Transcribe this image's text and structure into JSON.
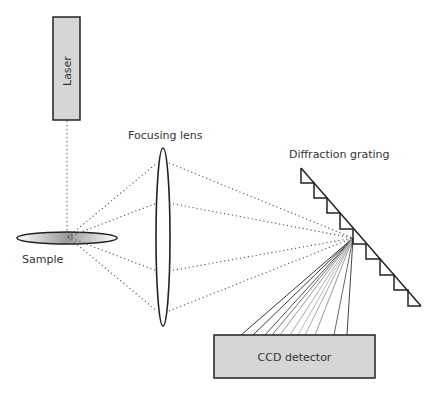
{
  "diagram": {
    "type": "raman-spectrometer-schematic",
    "components": {
      "laser": {
        "label": "Laser"
      },
      "sample": {
        "label": "Sample"
      },
      "lens": {
        "label": "Focusing lens"
      },
      "grating": {
        "label": "Diffraction grating"
      },
      "detector": {
        "label": "CCD detector"
      }
    },
    "colors": {
      "box_fill": "#d6d6d6",
      "outline": "#222222",
      "text": "#333333",
      "dotted": "#555555"
    },
    "beams": {
      "collected_to_lens_y": [
        163,
        203,
        271,
        311
      ],
      "focus_point": [
        353,
        238
      ],
      "diffracted_to_ccd_x": [
        241,
        253,
        265,
        272,
        280,
        290,
        298,
        305,
        315,
        334,
        347
      ],
      "diffracted_colors": [
        "#333333",
        "#3a3a3a",
        "#555555",
        "#777777",
        "#999999",
        "#aaaaaa",
        "#bbbbbb",
        "#aaaaaa",
        "#999999",
        "#777777",
        "#444444"
      ]
    }
  }
}
